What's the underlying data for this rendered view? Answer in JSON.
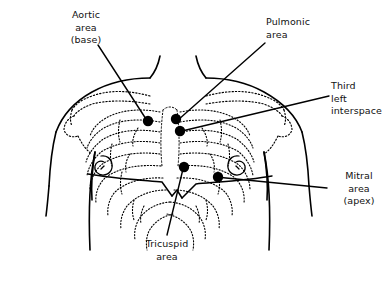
{
  "figure": {
    "style": "black-and-white line drawing with stippled ribs",
    "line_color": "#000000",
    "marker_color": "#000000",
    "background_color": "#ffffff"
  },
  "labels": {
    "aortic": {
      "lines": [
        "Aortic",
        "area",
        "(base)"
      ],
      "text": "Aortic\narea\n(base)",
      "align": "center"
    },
    "pulmonic": {
      "lines": [
        "Pulmonic",
        "area"
      ],
      "text": "Pulmonic\narea",
      "align": "left"
    },
    "third_left_interspace": {
      "lines": [
        "Third",
        "left",
        "interspace"
      ],
      "text": "Third\nleft\ninterspace",
      "align": "left"
    },
    "mitral": {
      "lines": [
        "Mitral",
        "area",
        "(apex)"
      ],
      "text": "Mitral\narea\n(apex)",
      "align": "center"
    },
    "tricuspid": {
      "lines": [
        "Tricuspid",
        "area"
      ],
      "text": "Tricuspid\narea",
      "align": "center"
    }
  },
  "markers": [
    {
      "name": "aortic-area-marker",
      "label": "Aortic area (base)",
      "x": 148,
      "y": 121,
      "r": 5.2
    },
    {
      "name": "pulmonic-area-marker",
      "label": "Pulmonic area",
      "x": 176,
      "y": 119,
      "r": 5.2
    },
    {
      "name": "third-left-interspace-marker",
      "label": "Third left interspace",
      "x": 180,
      "y": 131,
      "r": 5.2
    },
    {
      "name": "tricuspid-area-marker",
      "label": "Tricuspid area",
      "x": 184,
      "y": 167,
      "r": 5.2
    },
    {
      "name": "mitral-area-marker",
      "label": "Mitral area (apex)",
      "x": 218,
      "y": 177,
      "r": 5.2
    }
  ],
  "leader_lines": [
    {
      "name": "aortic-leader-line",
      "from_label": "Aortic area (base)",
      "x1": 98,
      "y1": 45,
      "x2": 146,
      "y2": 119
    },
    {
      "name": "pulmonic-leader-line",
      "from_label": "Pulmonic area",
      "x1": 265,
      "y1": 43,
      "x2": 178,
      "y2": 120
    },
    {
      "name": "third-leader-line",
      "from_label": "Third left interspace",
      "x1": 329,
      "y1": 96,
      "x2": 182,
      "y2": 131
    },
    {
      "name": "mitral-leader-line",
      "from_label": "Mitral area (apex)",
      "x1": 327,
      "y1": 188,
      "x2": 216,
      "y2": 177
    },
    {
      "name": "tricuspid-leader-line",
      "from_label": "Tricuspid area",
      "x1": 167,
      "y1": 235,
      "x2": 183,
      "y2": 169
    }
  ],
  "anatomy": {
    "parts": [
      "neck",
      "left-shoulder",
      "right-shoulder",
      "clavicle-left",
      "clavicle-right",
      "sternum",
      "ribcage-left",
      "ribcage-right",
      "costal-margin",
      "nipple-left",
      "nipple-right",
      "left-arm",
      "right-arm"
    ]
  }
}
